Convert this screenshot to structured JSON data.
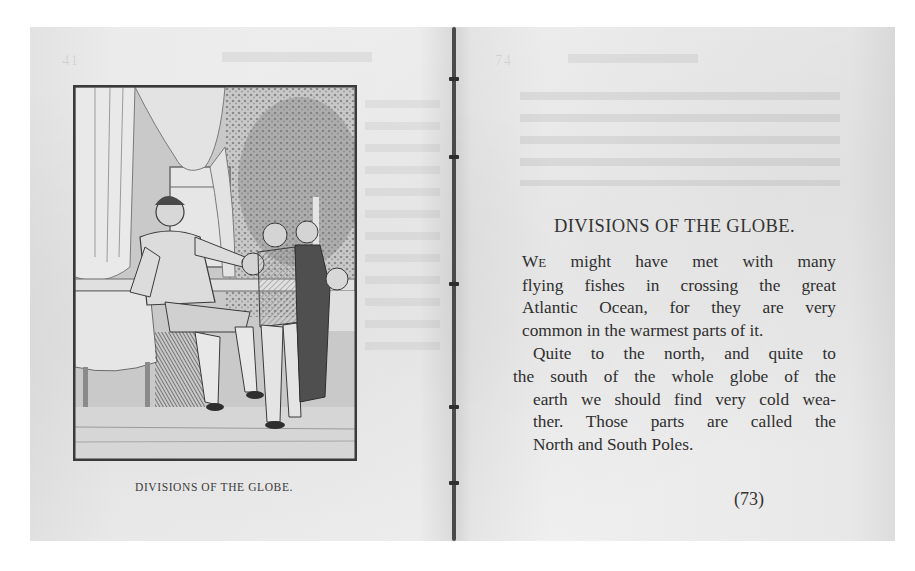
{
  "document": {
    "type": "scanned-book-spread",
    "background_color": "#ffffff",
    "paper_color": "#ebebeb",
    "ink_color": "#2f2f2f"
  },
  "left_page": {
    "illustration": {
      "subject": "engraving-man-seated-with-children",
      "description": "Seated gentleman at a table holding an object toward a group of boys, curtained window and foliage behind"
    },
    "caption": "DIVISIONS OF THE GLOBE.",
    "running_head_ghost": "41"
  },
  "right_page": {
    "heading": "DIVISIONS OF THE GLOBE.",
    "paragraph1": {
      "dropcap_first": "W",
      "dropcap_rest": "E",
      "lines": [
        " might have met with many",
        "flying fishes in crossing the great",
        "Atlantic Ocean, for they are very",
        "common in the warmest parts of it."
      ]
    },
    "paragraph2": {
      "lines": [
        "Quite to the north, and quite to",
        "the south of the whole globe of the",
        "earth we should find very cold wea-",
        "ther.  Those parts are called the",
        "North and South Poles."
      ]
    },
    "page_number": "(73)",
    "running_head_ghost": "74"
  }
}
